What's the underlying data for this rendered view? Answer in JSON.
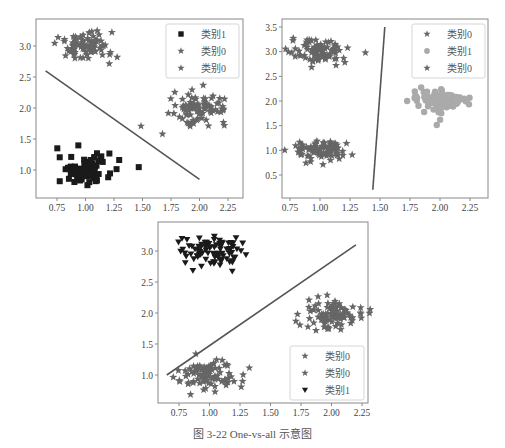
{
  "figure_caption": "图 3-22   One-vs-all 示意图",
  "colors": {
    "star": "#666666",
    "square": "#1a1a1a",
    "circle": "#aaaaaa",
    "triangle": "#1a1a1a",
    "line": "#555555",
    "axis": "#888888"
  },
  "chart_data": [
    {
      "type": "scatter",
      "title": "",
      "xlabel": "",
      "ylabel": "",
      "xlim": [
        0.62,
        2.4
      ],
      "ylim": [
        0.6,
        3.4
      ],
      "xticks": [
        "0.75",
        "1.00",
        "1.25",
        "1.50",
        "1.75",
        "2.00",
        "2.25"
      ],
      "yticks": [
        "1.0",
        "1.5",
        "2.0",
        "2.5",
        "3.0"
      ],
      "legend": {
        "position": "upper right",
        "entries": [
          {
            "label": "类别1",
            "marker": "square"
          },
          {
            "label": "类别0",
            "marker": "star"
          },
          {
            "label": "类别0",
            "marker": "star"
          }
        ]
      },
      "series": [
        {
          "name": "类别1",
          "marker": "square",
          "center": [
            1.0,
            1.0
          ],
          "spread": [
            0.15,
            0.15
          ]
        },
        {
          "name": "类别0",
          "marker": "star",
          "center": [
            1.0,
            3.0
          ],
          "spread": [
            0.15,
            0.15
          ]
        },
        {
          "name": "类别0",
          "marker": "star",
          "center": [
            2.0,
            2.0
          ],
          "spread": [
            0.15,
            0.15
          ]
        }
      ],
      "decision_line": {
        "x": [
          0.65,
          2.0
        ],
        "y": [
          2.6,
          0.85
        ]
      }
    },
    {
      "type": "scatter",
      "title": "",
      "xlabel": "",
      "ylabel": "",
      "xlim": [
        0.62,
        2.4
      ],
      "ylim": [
        0.1,
        3.6
      ],
      "xticks": [
        "0.75",
        "1.00",
        "1.25",
        "1.50",
        "1.75",
        "2.00",
        "2.25"
      ],
      "yticks": [
        "0.5",
        "1.0",
        "1.5",
        "2.0",
        "2.5",
        "3.0",
        "3.5"
      ],
      "legend": {
        "position": "upper right",
        "entries": [
          {
            "label": "类别0",
            "marker": "star"
          },
          {
            "label": "类别1",
            "marker": "circle"
          },
          {
            "label": "类别0",
            "marker": "star"
          }
        ]
      },
      "series": [
        {
          "name": "类别0",
          "marker": "star",
          "center": [
            1.0,
            3.0
          ],
          "spread": [
            0.15,
            0.15
          ]
        },
        {
          "name": "类别1",
          "marker": "circle",
          "center": [
            2.0,
            2.0
          ],
          "spread": [
            0.15,
            0.15
          ]
        },
        {
          "name": "类别0",
          "marker": "star",
          "center": [
            1.0,
            1.0
          ],
          "spread": [
            0.15,
            0.15
          ]
        }
      ],
      "decision_line": {
        "x": [
          1.44,
          1.54
        ],
        "y": [
          0.2,
          3.5
        ]
      }
    },
    {
      "type": "scatter",
      "title": "",
      "xlabel": "",
      "ylabel": "",
      "xlim": [
        0.6,
        2.4
      ],
      "ylim": [
        0.6,
        3.4
      ],
      "xticks": [
        "0.75",
        "1.00",
        "1.25",
        "1.50",
        "1.75",
        "2.00",
        "2.25"
      ],
      "yticks": [
        "1.0",
        "1.5",
        "2.0",
        "2.5",
        "3.0"
      ],
      "legend": {
        "position": "lower right",
        "entries": [
          {
            "label": "类别0",
            "marker": "star"
          },
          {
            "label": "类别0",
            "marker": "star"
          },
          {
            "label": "类别1",
            "marker": "triangle"
          }
        ]
      },
      "series": [
        {
          "name": "类别0",
          "marker": "star",
          "center": [
            1.0,
            1.0
          ],
          "spread": [
            0.15,
            0.15
          ]
        },
        {
          "name": "类别0",
          "marker": "star",
          "center": [
            2.0,
            2.0
          ],
          "spread": [
            0.15,
            0.15
          ]
        },
        {
          "name": "类别1",
          "marker": "triangle",
          "center": [
            1.0,
            3.0
          ],
          "spread": [
            0.15,
            0.15
          ]
        }
      ],
      "decision_line": {
        "x": [
          0.65,
          2.2
        ],
        "y": [
          1.0,
          3.1
        ]
      }
    }
  ]
}
